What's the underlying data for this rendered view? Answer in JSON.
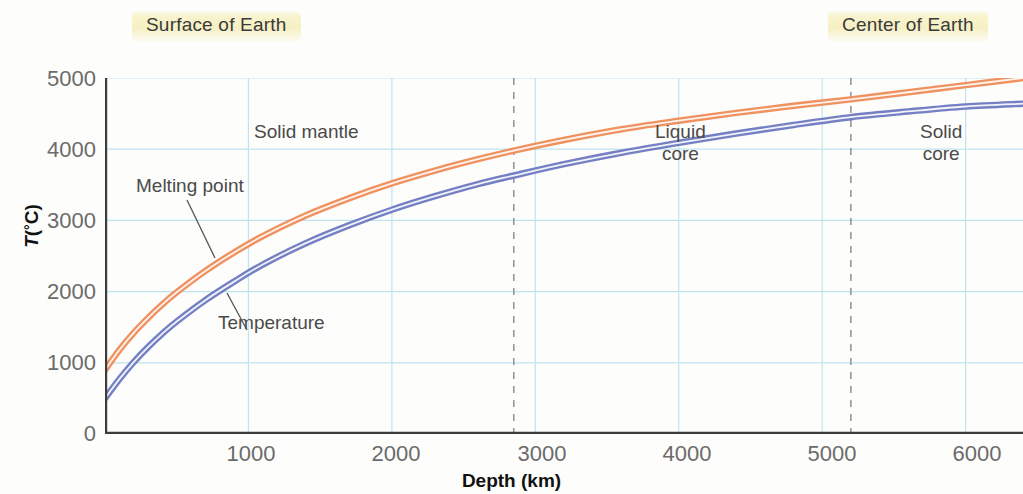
{
  "figure": {
    "top_labels": [
      {
        "key": "surface",
        "text": "Surface of Earth"
      },
      {
        "key": "center",
        "text": "Center of Earth"
      }
    ]
  },
  "axes": {
    "xlabel": "Depth (km)",
    "ylabel_symbol": "T",
    "ylabel_unit_deg": "°",
    "ylabel_unit_c": "C",
    "ylabel_full": "T(°C)",
    "xticks": [
      "1000",
      "2000",
      "3000",
      "4000",
      "5000",
      "6000"
    ],
    "yticks": [
      "0",
      "1000",
      "2000",
      "3000",
      "4000",
      "5000"
    ]
  },
  "annotations": {
    "solid_mantle": "Solid mantle",
    "melting_point": "Melting point",
    "temperature": "Temperature",
    "liquid_core_line1": "Liquid",
    "liquid_core_line2": "core",
    "solid_core_line1": "Solid",
    "solid_core_line2": "core"
  },
  "colors": {
    "melting_curve": "#ef8b57",
    "temperature_curve": "#6d79c0",
    "grid": "#bfe4ef",
    "axis": "#3c3c3c",
    "boundary_dash": "#8a8a8a",
    "highlight": "#f5efbe",
    "tick_text": "#6b6b6b",
    "annotation_text": "#4a4a4a"
  },
  "chart_data": {
    "type": "line",
    "title": "",
    "xlabel": "Depth (km)",
    "ylabel": "T(°C)",
    "xlim": [
      0,
      6400
    ],
    "ylim": [
      0,
      5000
    ],
    "grid": true,
    "legend": "inline-annotations",
    "xticks": [
      1000,
      2000,
      3000,
      4000,
      5000,
      6000
    ],
    "yticks": [
      0,
      1000,
      2000,
      3000,
      4000,
      5000
    ],
    "x": [
      0,
      100,
      200,
      300,
      400,
      500,
      700,
      900,
      1100,
      1400,
      1700,
      2000,
      2300,
      2600,
      2850,
      3200,
      3600,
      4000,
      4400,
      4800,
      5200,
      5600,
      6000,
      6400
    ],
    "series": [
      {
        "name": "Melting point",
        "color": "#ef8b57",
        "values": [
          900,
          1180,
          1420,
          1630,
          1820,
          1990,
          2290,
          2550,
          2780,
          3070,
          3310,
          3520,
          3700,
          3860,
          3980,
          4130,
          4280,
          4400,
          4510,
          4610,
          4700,
          4800,
          4900,
          5000
        ]
      },
      {
        "name": "Temperature",
        "color": "#6d79c0",
        "values": [
          500,
          770,
          1010,
          1220,
          1410,
          1580,
          1880,
          2140,
          2380,
          2680,
          2930,
          3150,
          3340,
          3510,
          3630,
          3790,
          3950,
          4090,
          4220,
          4340,
          4450,
          4530,
          4600,
          4640
        ]
      }
    ],
    "boundaries": [
      {
        "depth": 2850,
        "label": "mantle / liquid core"
      },
      {
        "depth": 5200,
        "label": "liquid core / solid core"
      }
    ],
    "regions": [
      {
        "label": "Solid mantle",
        "from": 0,
        "to": 2850
      },
      {
        "label": "Liquid core",
        "from": 2850,
        "to": 5200
      },
      {
        "label": "Solid core",
        "from": 5200,
        "to": 6400
      }
    ]
  }
}
